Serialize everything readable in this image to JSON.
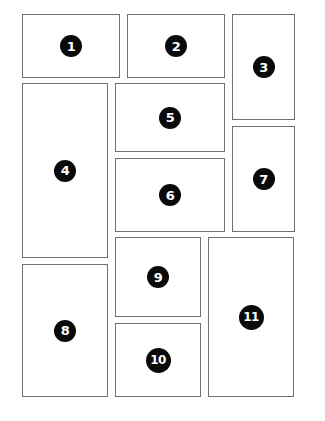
{
  "diagram": {
    "type": "page-layout-grid",
    "panel_border_color": "#6f6f6f",
    "badge_color": "#0a0a0a",
    "badge_text_color": "#ffffff",
    "panels": [
      {
        "label": "1",
        "x": 22,
        "y": 14,
        "w": 98,
        "h": 64
      },
      {
        "label": "2",
        "x": 127,
        "y": 14,
        "w": 98,
        "h": 64
      },
      {
        "label": "3",
        "x": 232,
        "y": 14,
        "w": 63,
        "h": 106
      },
      {
        "label": "4",
        "x": 22,
        "y": 83,
        "w": 86,
        "h": 175
      },
      {
        "label": "5",
        "x": 115,
        "y": 83,
        "w": 110,
        "h": 69
      },
      {
        "label": "6",
        "x": 115,
        "y": 158,
        "w": 110,
        "h": 74
      },
      {
        "label": "7",
        "x": 232,
        "y": 126,
        "w": 63,
        "h": 106
      },
      {
        "label": "8",
        "x": 22,
        "y": 264,
        "w": 86,
        "h": 133
      },
      {
        "label": "9",
        "x": 115,
        "y": 237,
        "w": 86,
        "h": 80
      },
      {
        "label": "10",
        "x": 115,
        "y": 323,
        "w": 86,
        "h": 74
      },
      {
        "label": "11",
        "x": 208,
        "y": 237,
        "w": 86,
        "h": 160
      }
    ]
  }
}
